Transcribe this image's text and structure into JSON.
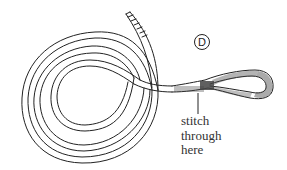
{
  "figure": {
    "label": "D",
    "caption_lines": [
      "stitch",
      "through",
      "here"
    ],
    "colors": {
      "line": "#222222",
      "background": "#ffffff"
    }
  }
}
